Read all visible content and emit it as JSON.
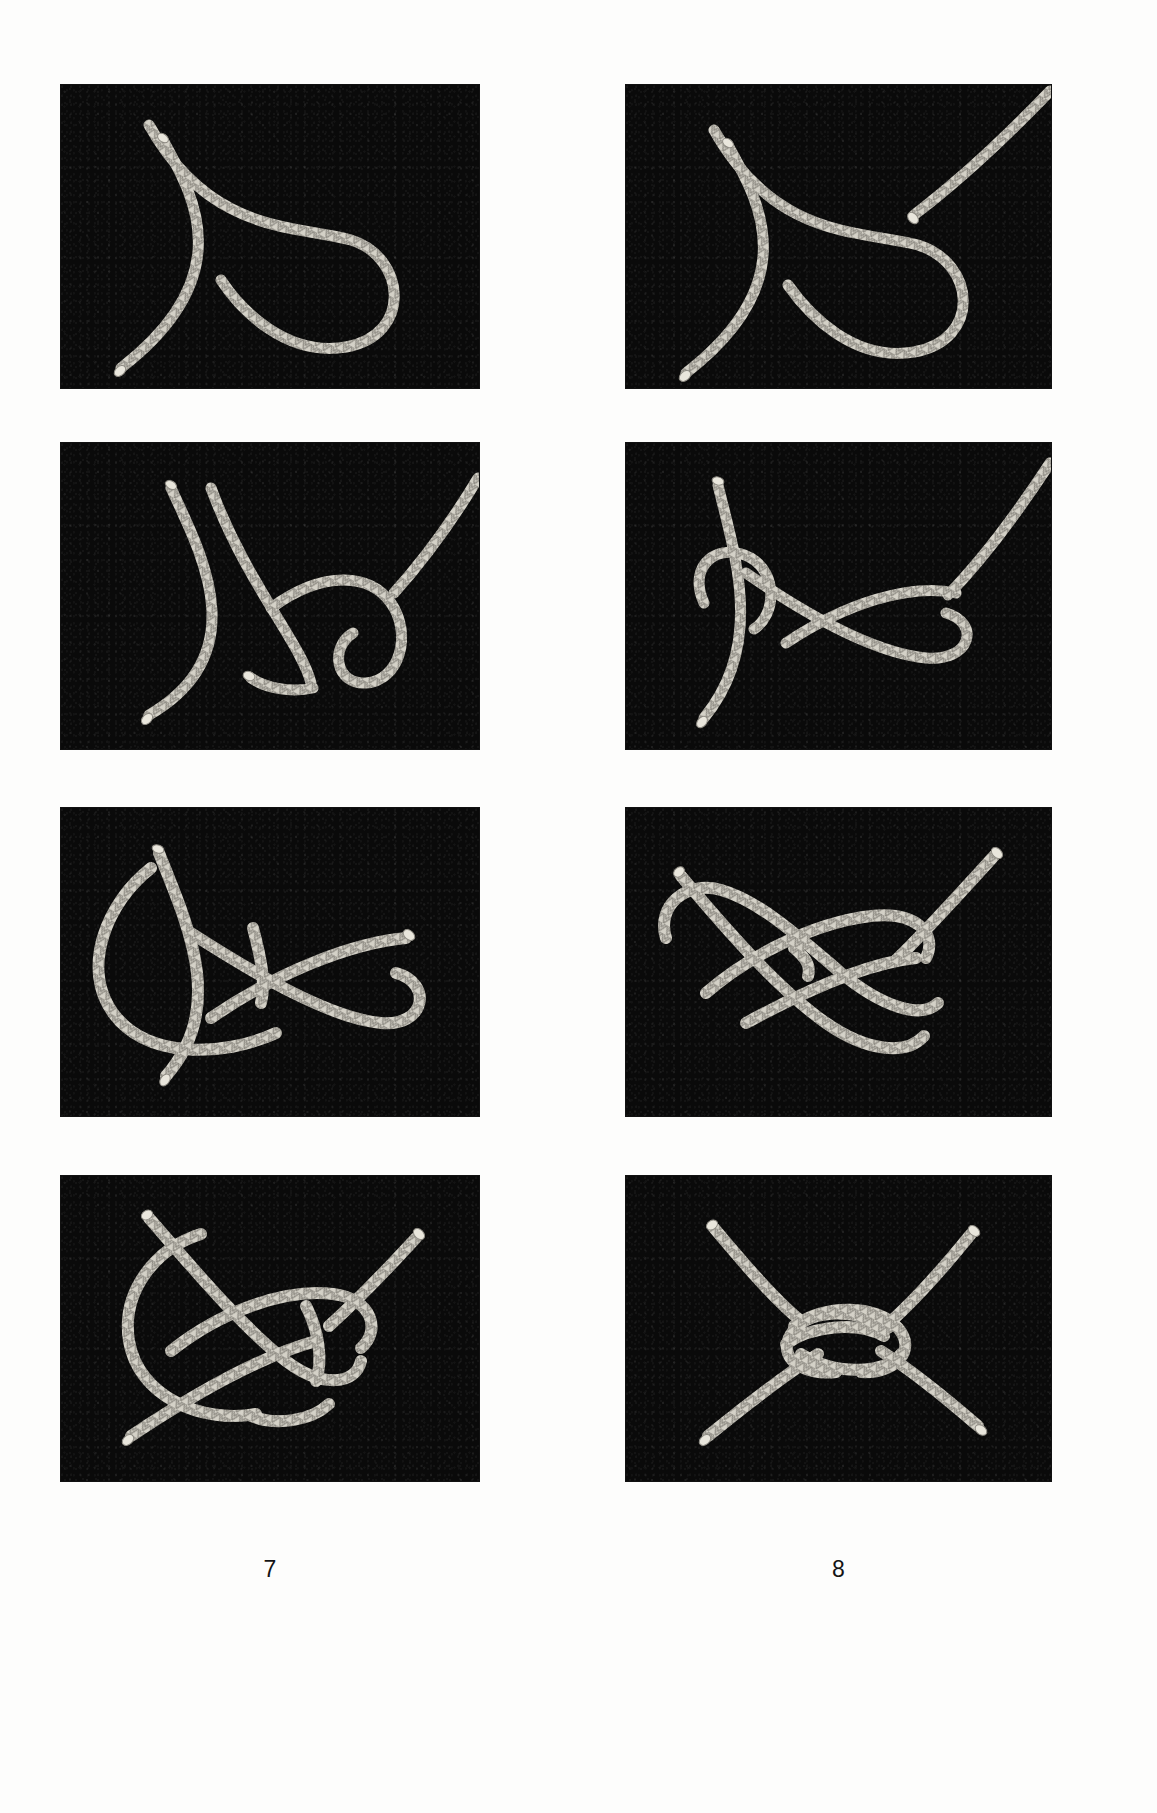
{
  "page": {
    "background_color": "#ffffff",
    "photo_background_color": "#0a0a0a",
    "rope_color": "#d8d5cb",
    "caption_color": "#141414",
    "columns": 2,
    "rows": 4,
    "total_figures": 8
  },
  "figures": [
    {
      "caption": "1",
      "alt": "Rope laid out with a single crossing turn forming an open loop to the right; the working end runs up to the upper left and the whipped tail end points to the lower left.",
      "step_description": "Form a loop in the standing part with the end crossing over itself."
    },
    {
      "caption": "2",
      "alt": "Second rope introduced from the upper right; its whipped end lies above the loop formed in step one.",
      "step_description": "Bring the second rope's end down toward the loop."
    },
    {
      "caption": "3",
      "alt": "Second rope passed down through the loop, its whipped end emerging below the crossing point.",
      "step_description": "Pass the second rope's end down through the loop."
    },
    {
      "caption": "4",
      "alt": "Second rope tucked around behind the standing parts, starting to encircle both legs of the loop.",
      "step_description": "Lead the end around behind both parts of the loop."
    },
    {
      "caption": "5",
      "alt": "Second rope brought around the back and back toward the front, its whipped end pointing to the upper right.",
      "step_description": "Bring the end back around to the front of the knot."
    },
    {
      "caption": "6",
      "alt": "End tucked back under itself so the knot begins to take its symmetrical interwoven form.",
      "step_description": "Tuck the end back under its own standing part."
    },
    {
      "caption": "7",
      "alt": "Knot partly drawn up, both whipped ends visible at upper right and lower left with interlocking bights.",
      "step_description": "Begin to draw the knot up, working out the slack."
    },
    {
      "caption": "8",
      "alt": "Completed knot drawn tight into a compact symmetrical bend with four rope legs radiating outward.",
      "step_description": "Draw the knot up tight to complete the bend."
    }
  ],
  "layout": {
    "photo_width": 425,
    "photo_height": 360,
    "column_x": [
      61,
      626
    ],
    "row_y": [
      85,
      444
    ],
    "caption_row_y": [
      452,
      824,
      1190,
      1558
    ]
  }
}
